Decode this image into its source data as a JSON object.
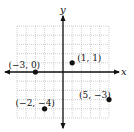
{
  "chart_data": {
    "type": "scatter",
    "title": "",
    "xlabel": "x",
    "ylabel": "y",
    "xlim": [
      -5,
      5
    ],
    "ylim": [
      -5,
      5
    ],
    "grid": true,
    "legend": null,
    "points": [
      {
        "x": -3,
        "y": 0,
        "label": "(−3, 0)"
      },
      {
        "x": 1,
        "y": 1,
        "label": "(1, 1)"
      },
      {
        "x": -2,
        "y": -4,
        "label": "(−2, −4)"
      },
      {
        "x": 5,
        "y": -3,
        "label": "(5, −3)"
      }
    ]
  },
  "layout": {
    "origin_px": [
      63,
      72
    ],
    "unit_px": 9.2,
    "label_offsets": [
      [
        -27,
        -4
      ],
      [
        5,
        -2
      ],
      [
        -29,
        -3
      ],
      [
        -30,
        -2
      ]
    ]
  }
}
